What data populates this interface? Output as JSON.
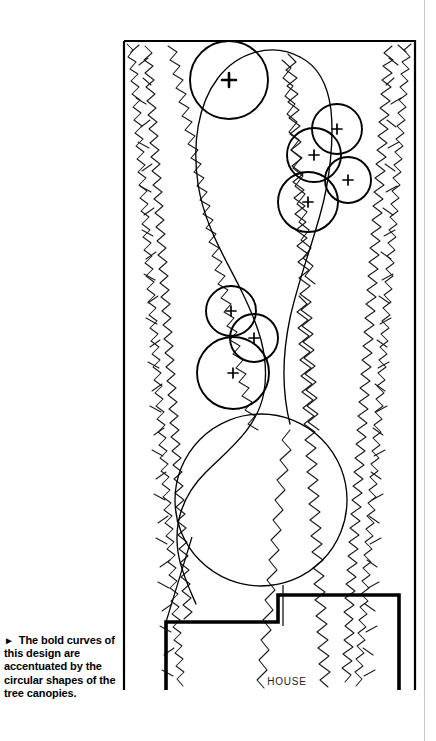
{
  "page": {
    "width": 436,
    "height": 741,
    "background": "#ffffff",
    "ink": "#000000",
    "rule_color": "#c9c9c9"
  },
  "caption": {
    "bullet": "►",
    "text": "The bold curves of this design are accentuated by the circular shapes of the tree canopies."
  },
  "labels": {
    "house": "HOUSE"
  },
  "plan": {
    "title": "landscape-design-plan",
    "property_boundary": {
      "left": 124,
      "top": 40,
      "right": 415,
      "bottom": 690,
      "stroke_width": 2.2
    },
    "house_outline": {
      "stroke_width": 3.4,
      "points": "166,690 166,622 278,622 278,595 399,595 399,690"
    },
    "lawn_label": "bold-curve-lawn",
    "lawn_path": "M 300 58 C 268 44 236 56 218 80 C 196 110 190 150 196 190 C 202 232 222 262 238 292 C 256 326 268 356 262 392 C 256 428 228 448 206 470 C 184 492 174 520 178 548 C 181 570 190 588 196 604",
    "tree_canopies": [
      {
        "id": "tree-1",
        "cx": 229,
        "cy": 80,
        "r": 39,
        "stroke_width": 1.8,
        "marker": "+"
      },
      {
        "id": "tree-2",
        "cx": 337,
        "cy": 129,
        "r": 25,
        "stroke_width": 1.8,
        "marker": "+"
      },
      {
        "id": "tree-3",
        "cx": 314,
        "cy": 155,
        "r": 27,
        "stroke_width": 1.8,
        "marker": "+"
      },
      {
        "id": "tree-4",
        "cx": 348,
        "cy": 180,
        "r": 23,
        "stroke_width": 1.8,
        "marker": "+"
      },
      {
        "id": "tree-5",
        "cx": 308,
        "cy": 202,
        "r": 30,
        "stroke_width": 1.8,
        "marker": "+"
      },
      {
        "id": "tree-6",
        "cx": 231,
        "cy": 311,
        "r": 25,
        "stroke_width": 1.8,
        "marker": "+"
      },
      {
        "id": "tree-7",
        "cx": 254,
        "cy": 338,
        "r": 24,
        "stroke_width": 1.8,
        "marker": "+"
      },
      {
        "id": "tree-8",
        "cx": 233,
        "cy": 373,
        "r": 36,
        "stroke_width": 1.8,
        "marker": "+"
      }
    ],
    "lawn_circle": {
      "id": "lawn-circle",
      "cx": 261,
      "cy": 500,
      "r": 86,
      "stroke_width": 1.3
    },
    "shrub_beds": [
      {
        "id": "shrub-bed-left",
        "side": "left"
      },
      {
        "id": "shrub-bed-right",
        "side": "right"
      }
    ]
  }
}
